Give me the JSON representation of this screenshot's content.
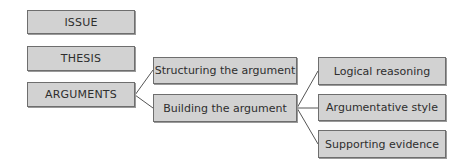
{
  "diagram": {
    "type": "tree",
    "level1": [
      {
        "id": "issue",
        "label": "ISSUE"
      },
      {
        "id": "thesis",
        "label": "THESIS"
      },
      {
        "id": "arguments",
        "label": "ARGUMENTS"
      }
    ],
    "level2": [
      {
        "id": "structuring",
        "label": "Structuring the argument",
        "parent": "arguments"
      },
      {
        "id": "building",
        "label": "Building the argument",
        "parent": "arguments"
      }
    ],
    "level3": [
      {
        "id": "logical",
        "label": "Logical reasoning",
        "parent": "building"
      },
      {
        "id": "style",
        "label": "Argumentative style",
        "parent": "building"
      },
      {
        "id": "evidence",
        "label": "Supporting evidence",
        "parent": "building"
      }
    ],
    "colors": {
      "box_fill": "#d2d2d2",
      "box_border": "#6e6e6e",
      "text": "#2e2e2e",
      "connector": "#555555"
    }
  }
}
